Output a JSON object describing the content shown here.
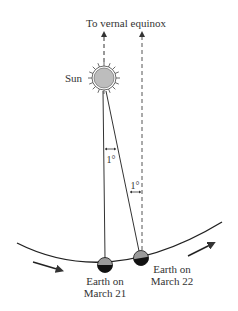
{
  "diagram": {
    "top_label": "To vernal equinox",
    "sun_label": "Sun",
    "angle_label_1": "1°",
    "angle_label_2": "1°",
    "earth1_label_line1": "Earth on",
    "earth1_label_line2": "March 21",
    "earth2_label_line1": "Earth on",
    "earth2_label_line2": "March 22",
    "colors": {
      "line": "#333333",
      "sun_fill": "#bdbdbd",
      "earth_lit": "#9a9a9a",
      "earth_dark": "#111111"
    }
  }
}
